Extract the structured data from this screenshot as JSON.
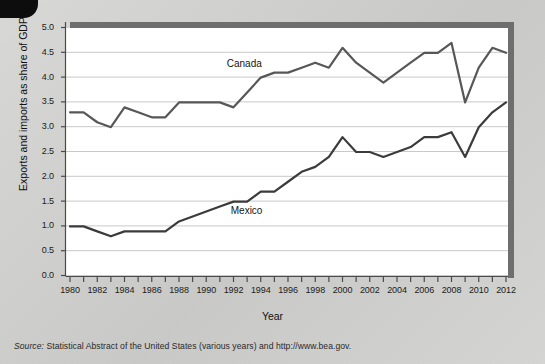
{
  "figure": {
    "y_axis_title": "Exports and imports as share of GDP",
    "x_axis_title": "Year",
    "source_prefix": "Source:",
    "source_text": " Statistical Abstract of the United States (various years) and http://www.bea.gov.",
    "canada_label": "Canada",
    "mexico_label": "Mexico",
    "line_color": "#575757",
    "mexico_color": "#3b3b3b",
    "grid_color": "#c9c9c9",
    "axis_color": "#4a4a4a",
    "plot_bg": "#ffffff",
    "page_bg": "#cfcfcd"
  },
  "chart_data": {
    "type": "line",
    "title": "",
    "xlabel": "Year",
    "ylabel": "Exports and imports as share of GDP",
    "xlim": [
      1980,
      2012
    ],
    "ylim": [
      0.0,
      5.0
    ],
    "grid": true,
    "legend": "inline-annotations",
    "ytick_labels": [
      "0.0",
      "0.5",
      "1.0",
      "1.5",
      "2.0",
      "2.5",
      "3.0",
      "3.5",
      "4.0",
      "4.5",
      "5.0"
    ],
    "ytick_values": [
      0.0,
      0.5,
      1.0,
      1.5,
      2.0,
      2.5,
      3.0,
      3.5,
      4.0,
      4.5,
      5.0
    ],
    "xtick_labels": [
      "1980",
      "1982",
      "1984",
      "1986",
      "1988",
      "1990",
      "1992",
      "1994",
      "1996",
      "1998",
      "2000",
      "2002",
      "2004",
      "2006",
      "2008",
      "2010",
      "2012"
    ],
    "xtick_values": [
      1980,
      1982,
      1984,
      1986,
      1988,
      1990,
      1992,
      1994,
      1996,
      1998,
      2000,
      2002,
      2004,
      2006,
      2008,
      2010,
      2012
    ],
    "minor_xticks_every": 1,
    "x": [
      1980,
      1981,
      1982,
      1983,
      1984,
      1985,
      1986,
      1987,
      1988,
      1989,
      1990,
      1991,
      1992,
      1993,
      1994,
      1995,
      1996,
      1997,
      1998,
      1999,
      2000,
      2001,
      2002,
      2003,
      2004,
      2005,
      2006,
      2007,
      2008,
      2009,
      2010,
      2011,
      2012
    ],
    "series": [
      {
        "name": "Canada",
        "color": "#575757",
        "values": [
          3.3,
          3.3,
          3.1,
          3.0,
          3.4,
          3.3,
          3.2,
          3.2,
          3.5,
          3.5,
          3.5,
          3.5,
          3.4,
          3.7,
          4.0,
          4.1,
          4.1,
          4.2,
          4.3,
          4.2,
          4.6,
          4.3,
          4.1,
          3.9,
          4.1,
          4.3,
          4.5,
          4.5,
          4.7,
          3.5,
          4.2,
          4.6,
          4.5
        ],
        "label_position": {
          "x": 1994,
          "y": 4.25
        }
      },
      {
        "name": "Mexico",
        "color": "#3b3b3b",
        "values": [
          1.0,
          1.0,
          0.9,
          0.8,
          0.9,
          0.9,
          0.9,
          0.9,
          1.1,
          1.2,
          1.3,
          1.4,
          1.5,
          1.5,
          1.7,
          1.7,
          1.9,
          2.1,
          2.2,
          2.4,
          2.8,
          2.5,
          2.5,
          2.4,
          2.5,
          2.6,
          2.8,
          2.8,
          2.9,
          2.4,
          3.0,
          3.3,
          3.5
        ],
        "label_position": {
          "x": 1994,
          "y": 1.3
        }
      }
    ]
  }
}
